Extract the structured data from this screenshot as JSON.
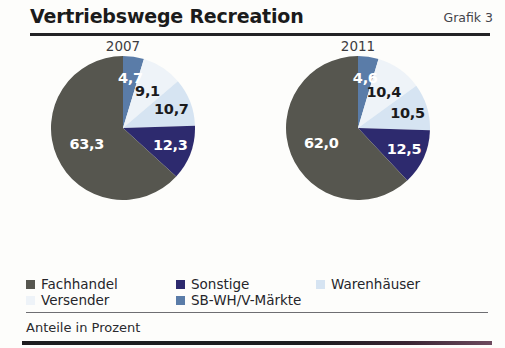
{
  "header": {
    "title": "Vertriebswege Recreation",
    "grafik_label": "Grafik 3"
  },
  "footer": {
    "note": "Anteile in Prozent"
  },
  "legend": {
    "items": [
      {
        "label": "Fachhandel",
        "color": "#56564f"
      },
      {
        "label": "Sonstige",
        "color": "#2d2a6e"
      },
      {
        "label": "Warenhäuser",
        "color": "#d6e4f2"
      },
      {
        "label": "Versender",
        "color": "#eef3f8"
      },
      {
        "label": "SB-WH/V-Märkte",
        "color": "#5a7ca8"
      }
    ]
  },
  "chart_data": {
    "type": "pie",
    "title": "Vertriebswege Recreation",
    "subtitle": "Grafik 3",
    "ylabel": "Anteile in Prozent",
    "unit": "percent",
    "legend_position": "bottom",
    "grid": false,
    "categories": [
      "SB-WH/V-Märkte",
      "Versender",
      "Warenhäuser",
      "Sonstige",
      "Fachhandel"
    ],
    "colors": [
      "#5a7ca8",
      "#eef3f8",
      "#d6e4f2",
      "#2d2a6e",
      "#56564f"
    ],
    "charts": [
      {
        "name": "2007",
        "slices": [
          {
            "category": "SB-WH/V-Märkte",
            "value": 4.7,
            "label": "4,7",
            "color": "#5a7ca8",
            "label_color": "light"
          },
          {
            "category": "Versender",
            "value": 9.1,
            "label": "9,1",
            "color": "#eef3f8",
            "label_color": "dark"
          },
          {
            "category": "Warenhäuser",
            "value": 10.7,
            "label": "10,7",
            "color": "#d6e4f2",
            "label_color": "dark"
          },
          {
            "category": "Sonstige",
            "value": 12.3,
            "label": "12,3",
            "color": "#2d2a6e",
            "label_color": "light"
          },
          {
            "category": "Fachhandel",
            "value": 63.3,
            "label": "63,3",
            "color": "#56564f",
            "label_color": "light"
          }
        ]
      },
      {
        "name": "2011",
        "slices": [
          {
            "category": "SB-WH/V-Märkte",
            "value": 4.6,
            "label": "4,6",
            "color": "#5a7ca8",
            "label_color": "light"
          },
          {
            "category": "Versender",
            "value": 10.4,
            "label": "10,4",
            "color": "#eef3f8",
            "label_color": "dark"
          },
          {
            "category": "Warenhäuser",
            "value": 10.5,
            "label": "10,5",
            "color": "#d6e4f2",
            "label_color": "dark"
          },
          {
            "category": "Sonstige",
            "value": 12.5,
            "label": "12,5",
            "color": "#2d2a6e",
            "label_color": "light"
          },
          {
            "category": "Fachhandel",
            "value": 62.0,
            "label": "62,0",
            "color": "#56564f",
            "label_color": "light"
          }
        ]
      }
    ]
  }
}
